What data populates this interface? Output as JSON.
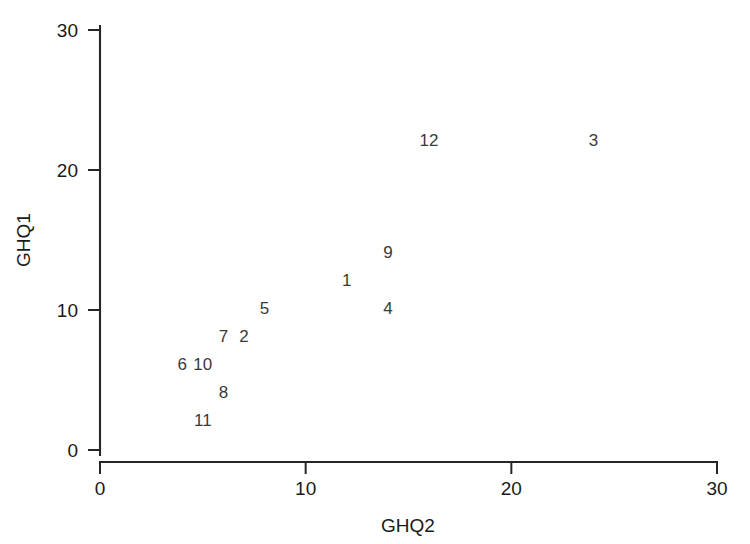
{
  "chart_data": {
    "type": "scatter",
    "title": "",
    "xlabel": "GHQ2",
    "ylabel": "GHQ1",
    "xlim": [
      0,
      30
    ],
    "ylim": [
      0,
      30
    ],
    "xticks": [
      0,
      10,
      20,
      30
    ],
    "yticks": [
      0,
      10,
      20,
      30
    ],
    "xtick_labels": [
      "0",
      "10",
      "20",
      "30"
    ],
    "ytick_labels": [
      "0",
      "10",
      "20",
      "30"
    ],
    "grid": false,
    "legend": false,
    "marker_style": "text-label",
    "points": [
      {
        "label": "1",
        "x": 12,
        "y": 12
      },
      {
        "label": "2",
        "x": 7,
        "y": 8
      },
      {
        "label": "3",
        "x": 24,
        "y": 22
      },
      {
        "label": "4",
        "x": 14,
        "y": 10
      },
      {
        "label": "5",
        "x": 8,
        "y": 10
      },
      {
        "label": "6",
        "x": 4,
        "y": 6
      },
      {
        "label": "7",
        "x": 6,
        "y": 8
      },
      {
        "label": "8",
        "x": 6,
        "y": 4
      },
      {
        "label": "9",
        "x": 14,
        "y": 14
      },
      {
        "label": "10",
        "x": 5,
        "y": 6
      },
      {
        "label": "11",
        "x": 5,
        "y": 2
      },
      {
        "label": "12",
        "x": 16,
        "y": 22
      }
    ]
  },
  "colors": {
    "background": "#ffffff",
    "axis": "#262626",
    "text": "#1a1a1a",
    "point_label": "#3a3a3a"
  }
}
